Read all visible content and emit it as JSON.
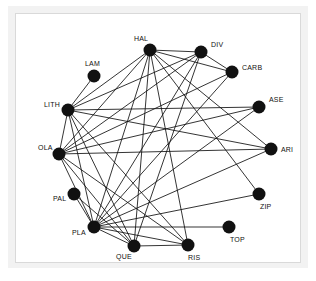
{
  "figure": {
    "title": "",
    "background_color": "#ffffff",
    "frame_color": "#f2f2f2",
    "panel_color": "#ffffff",
    "panel_border_color": "#d9d9d9"
  },
  "chart_data": {
    "type": "diagram",
    "diagram_type": "network-graph",
    "title": "",
    "xlabel": "",
    "ylabel": "",
    "grid": false,
    "legend": null,
    "layout": "circular",
    "directed": false,
    "node_color": "#111111",
    "edge_color": "#111111",
    "node_radius": 6.5,
    "node_count": 15,
    "edge_count": 37,
    "coordinate_space": {
      "width": 286,
      "height": 250
    },
    "nodes": [
      {
        "id": "HAL",
        "label": "HAL",
        "x": 134,
        "y": 36,
        "label_dx": -16,
        "label_dy": -9,
        "degree": 9
      },
      {
        "id": "DIV",
        "label": "DIV",
        "x": 185,
        "y": 38,
        "label_dx": 10,
        "label_dy": -5,
        "degree": 6
      },
      {
        "id": "CARB",
        "label": "CARB",
        "x": 216,
        "y": 58,
        "label_dx": 10,
        "label_dy": -2,
        "degree": 4
      },
      {
        "id": "ASE",
        "label": "ASE",
        "x": 243,
        "y": 93,
        "label_dx": 10,
        "label_dy": -5,
        "degree": 3
      },
      {
        "id": "ARI",
        "label": "ARI",
        "x": 255,
        "y": 135,
        "label_dx": 10,
        "label_dy": 3,
        "degree": 4
      },
      {
        "id": "ZIP",
        "label": "ZIP",
        "x": 243,
        "y": 180,
        "label_dx": 1,
        "label_dy": 15,
        "degree": 2
      },
      {
        "id": "TOP",
        "label": "TOP",
        "x": 213,
        "y": 213,
        "label_dx": 1,
        "label_dy": 15,
        "degree": 1
      },
      {
        "id": "RIS",
        "label": "RIS",
        "x": 172,
        "y": 231,
        "label_dx": 0,
        "label_dy": 15,
        "degree": 5
      },
      {
        "id": "QUE",
        "label": "QUE",
        "x": 118,
        "y": 232,
        "label_dx": -18,
        "label_dy": 13,
        "degree": 6
      },
      {
        "id": "PLA",
        "label": "PLA",
        "x": 78,
        "y": 213,
        "label_dx": -22,
        "label_dy": 8,
        "degree": 14
      },
      {
        "id": "PAL",
        "label": "PAL",
        "x": 58,
        "y": 180,
        "label_dx": -21,
        "label_dy": 7,
        "degree": 2
      },
      {
        "id": "OLA",
        "label": "OLA",
        "x": 43,
        "y": 140,
        "label_dx": -21,
        "label_dy": -4,
        "degree": 8
      },
      {
        "id": "LITH",
        "label": "LITH",
        "x": 52,
        "y": 96,
        "label_dx": -24,
        "label_dy": -3,
        "degree": 7
      },
      {
        "id": "LAM",
        "label": "LAM",
        "x": 78,
        "y": 62,
        "label_dx": -9,
        "label_dy": -10,
        "degree": 1
      },
      {
        "id": "TOPX",
        "label": "",
        "x": 0,
        "y": 0,
        "label_dx": 0,
        "label_dy": 0,
        "degree": 0
      }
    ],
    "edges": [
      {
        "source": "HAL",
        "target": "DIV"
      },
      {
        "source": "HAL",
        "target": "CARB"
      },
      {
        "source": "HAL",
        "target": "LITH"
      },
      {
        "source": "HAL",
        "target": "OLA"
      },
      {
        "source": "HAL",
        "target": "PLA"
      },
      {
        "source": "HAL",
        "target": "QUE"
      },
      {
        "source": "HAL",
        "target": "RIS"
      },
      {
        "source": "HAL",
        "target": "ARI"
      },
      {
        "source": "HAL",
        "target": "ZIP"
      },
      {
        "source": "DIV",
        "target": "CARB"
      },
      {
        "source": "DIV",
        "target": "LITH"
      },
      {
        "source": "DIV",
        "target": "OLA"
      },
      {
        "source": "DIV",
        "target": "PLA"
      },
      {
        "source": "DIV",
        "target": "QUE"
      },
      {
        "source": "CARB",
        "target": "PLA"
      },
      {
        "source": "CARB",
        "target": "OLA"
      },
      {
        "source": "ASE",
        "target": "PLA"
      },
      {
        "source": "ASE",
        "target": "OLA"
      },
      {
        "source": "ASE",
        "target": "LITH"
      },
      {
        "source": "ARI",
        "target": "PLA"
      },
      {
        "source": "ARI",
        "target": "LITH"
      },
      {
        "source": "ARI",
        "target": "OLA"
      },
      {
        "source": "ZIP",
        "target": "PLA"
      },
      {
        "source": "TOP",
        "target": "PLA"
      },
      {
        "source": "RIS",
        "target": "PLA"
      },
      {
        "source": "RIS",
        "target": "QUE"
      },
      {
        "source": "RIS",
        "target": "OLA"
      },
      {
        "source": "RIS",
        "target": "LITH"
      },
      {
        "source": "QUE",
        "target": "PLA"
      },
      {
        "source": "QUE",
        "target": "OLA"
      },
      {
        "source": "QUE",
        "target": "LITH"
      },
      {
        "source": "PLA",
        "target": "PAL"
      },
      {
        "source": "PLA",
        "target": "OLA"
      },
      {
        "source": "PLA",
        "target": "LITH"
      },
      {
        "source": "PAL",
        "target": "QUE"
      },
      {
        "source": "OLA",
        "target": "LITH"
      },
      {
        "source": "LITH",
        "target": "LAM"
      }
    ]
  }
}
